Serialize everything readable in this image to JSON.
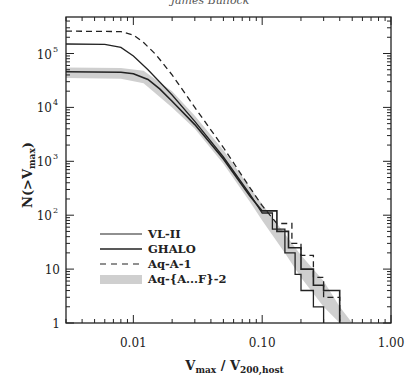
{
  "header": {
    "author": "James Bullock"
  },
  "chart_data": {
    "type": "line",
    "title": "",
    "xlabel": "V_max / V_200,host",
    "ylabel": "N(>V_max)",
    "xscale": "log",
    "yscale": "log",
    "xlim": [
      0.003,
      1.0
    ],
    "ylim": [
      1,
      480000
    ],
    "x_ticks": [
      {
        "value": 0.01,
        "label": "0.01"
      },
      {
        "value": 0.1,
        "label": "0.10"
      },
      {
        "value": 1.0,
        "label": "1.00"
      }
    ],
    "y_ticks": [
      {
        "value": 1,
        "label": "1"
      },
      {
        "value": 10,
        "label": "10"
      },
      {
        "value": 100,
        "label": "10",
        "exp": "2"
      },
      {
        "value": 1000,
        "label": "10",
        "exp": "3"
      },
      {
        "value": 10000,
        "label": "10",
        "exp": "4"
      },
      {
        "value": 100000,
        "label": "10",
        "exp": "5"
      }
    ],
    "grid": false,
    "legend_position": "lower-left",
    "series": [
      {
        "name": "VL-II",
        "style": "solid",
        "x": [
          0.003,
          0.006,
          0.008,
          0.01,
          0.013,
          0.02,
          0.03,
          0.05,
          0.08,
          0.1,
          0.12,
          0.15,
          0.18,
          0.2,
          0.25,
          0.3
        ],
        "y": [
          150000,
          148000,
          130000,
          90000,
          50000,
          17000,
          5500,
          1200,
          250,
          110,
          55,
          20,
          8,
          4,
          2,
          1
        ]
      },
      {
        "name": "GHALO",
        "style": "solid",
        "x": [
          0.003,
          0.008,
          0.01,
          0.013,
          0.016,
          0.02,
          0.03,
          0.05,
          0.08,
          0.1,
          0.13,
          0.16,
          0.2,
          0.25,
          0.3,
          0.4
        ],
        "y": [
          46000,
          45000,
          42000,
          33000,
          22000,
          13000,
          4800,
          1100,
          230,
          120,
          50,
          25,
          10,
          5,
          4,
          1
        ]
      },
      {
        "name": "Aq-A-1",
        "style": "dashed",
        "x": [
          0.003,
          0.008,
          0.01,
          0.012,
          0.015,
          0.02,
          0.03,
          0.05,
          0.08,
          0.1,
          0.13,
          0.17,
          0.2,
          0.25,
          0.3,
          0.4
        ],
        "y": [
          260000,
          255000,
          220000,
          160000,
          95000,
          40000,
          10000,
          1800,
          330,
          150,
          70,
          30,
          18,
          7,
          3,
          1
        ]
      },
      {
        "name": "Aq-{A...F}-2",
        "style": "band",
        "x": [
          0.003,
          0.008,
          0.012,
          0.02,
          0.03,
          0.05,
          0.08,
          0.1,
          0.15,
          0.2,
          0.3,
          0.4,
          0.5
        ],
        "y_low": [
          35000,
          34000,
          28000,
          10000,
          4000,
          900,
          180,
          80,
          20,
          7,
          2,
          1,
          1
        ],
        "y_high": [
          55000,
          54000,
          48000,
          20000,
          7000,
          1600,
          330,
          160,
          45,
          18,
          6,
          2,
          1
        ]
      }
    ]
  },
  "legend": [
    {
      "label": "VL-II",
      "style": "solid"
    },
    {
      "label": "GHALO",
      "style": "solid"
    },
    {
      "label": "Aq-A-1",
      "style": "dashed"
    },
    {
      "label": "Aq-{A...F}-2",
      "style": "band"
    }
  ],
  "axes": {
    "x_title_main": "V",
    "x_title_sub1": "max",
    "x_title_mid": " / V",
    "x_title_sub2": "200,host",
    "y_title_main": "N(>V",
    "y_title_sub": "max",
    "y_title_end": ")"
  },
  "colors": {
    "line": "#222222",
    "band": "#cfcfcf",
    "frame": "#222222"
  }
}
